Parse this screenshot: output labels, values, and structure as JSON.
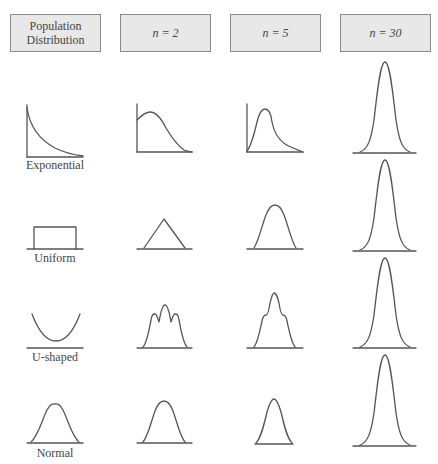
{
  "headers": [
    {
      "line1": "Population",
      "line2": "Distribution"
    },
    {
      "label": "n = 2"
    },
    {
      "label": "n = 5"
    },
    {
      "label": "n = 30"
    }
  ],
  "rows": [
    {
      "label": "Exponential"
    },
    {
      "label": "Uniform"
    },
    {
      "label": "U-shaped"
    },
    {
      "label": "Normal"
    }
  ],
  "colors": {
    "header_fill": "#e8e8e8",
    "header_border": "#8a8a8a",
    "curve_stroke": "#555555"
  }
}
